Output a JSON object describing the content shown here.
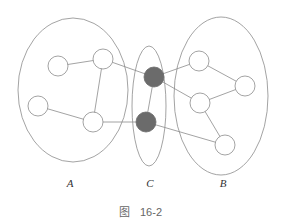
{
  "figure": {
    "caption_prefix": "图",
    "caption_number": "16-2",
    "stroke_color": "#8c8c8c",
    "fill_color": "#6b6b6b"
  },
  "groups": [
    {
      "id": "A",
      "label": "A",
      "cx": 73,
      "cy": 90,
      "rx": 55,
      "ry": 72,
      "label_x": 70,
      "label_y": 177
    },
    {
      "id": "C",
      "label": "C",
      "cx": 149,
      "cy": 106,
      "rx": 17,
      "ry": 60,
      "label_x": 150,
      "label_y": 177
    },
    {
      "id": "B",
      "label": "B",
      "cx": 221,
      "cy": 96,
      "rx": 47,
      "ry": 79,
      "label_x": 223,
      "label_y": 177
    }
  ],
  "nodes": [
    {
      "id": "a1",
      "group": "A",
      "x": 58,
      "y": 66,
      "r": 10,
      "filled": false
    },
    {
      "id": "a2",
      "group": "A",
      "x": 103,
      "y": 59,
      "r": 10,
      "filled": false
    },
    {
      "id": "a3",
      "group": "A",
      "x": 38,
      "y": 106,
      "r": 10,
      "filled": false
    },
    {
      "id": "a4",
      "group": "A",
      "x": 93,
      "y": 122,
      "r": 10,
      "filled": false
    },
    {
      "id": "c1",
      "group": "C",
      "x": 154,
      "y": 77,
      "r": 10,
      "filled": true
    },
    {
      "id": "c2",
      "group": "C",
      "x": 146,
      "y": 122,
      "r": 10,
      "filled": true
    },
    {
      "id": "b1",
      "group": "B",
      "x": 199,
      "y": 61,
      "r": 10,
      "filled": false
    },
    {
      "id": "b2",
      "group": "B",
      "x": 245,
      "y": 86,
      "r": 10,
      "filled": false
    },
    {
      "id": "b3",
      "group": "B",
      "x": 200,
      "y": 103,
      "r": 10,
      "filled": false
    },
    {
      "id": "b4",
      "group": "B",
      "x": 225,
      "y": 145,
      "r": 10,
      "filled": false
    }
  ],
  "edges": [
    [
      "a1",
      "a2"
    ],
    [
      "a2",
      "a4"
    ],
    [
      "a3",
      "a4"
    ],
    [
      "a2",
      "c1"
    ],
    [
      "a4",
      "c2"
    ],
    [
      "c1",
      "c2"
    ],
    [
      "c1",
      "b1"
    ],
    [
      "c1",
      "b3"
    ],
    [
      "c2",
      "b4"
    ],
    [
      "b1",
      "b2"
    ],
    [
      "b3",
      "b2"
    ],
    [
      "b3",
      "b4"
    ]
  ]
}
